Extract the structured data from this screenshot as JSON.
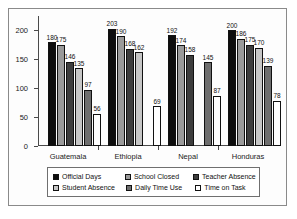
{
  "chart_data": {
    "type": "bar",
    "title": "",
    "subtitle": "",
    "xlabel": "",
    "ylabel": "",
    "ylim": [
      0,
      225
    ],
    "yticks": [
      0,
      50,
      100,
      150,
      200
    ],
    "grid": false,
    "legend_position": "bottom",
    "categories": [
      "Guatemala",
      "Ethiopia",
      "Nepal",
      "Honduras"
    ],
    "series": [
      {
        "name": "Official Days",
        "color": "#0d0d0d",
        "values": [
          180,
          203,
          192,
          200
        ]
      },
      {
        "name": "School Closed",
        "color": "#9a9a9a",
        "values": [
          175,
          190,
          174,
          186
        ]
      },
      {
        "name": "Teacher Absence",
        "color": "#3d3d3d",
        "values": [
          146,
          168,
          158,
          175
        ]
      },
      {
        "name": "Student Absence",
        "color": "#c6c6c6",
        "values": [
          135,
          162,
          null,
          170
        ]
      },
      {
        "name": "Daily Time Use",
        "color": "#6e6e6e",
        "values": [
          97,
          null,
          145,
          139
        ]
      },
      {
        "name": "Time on Task",
        "color": "#ffffff",
        "values": [
          56,
          69,
          87,
          78
        ]
      }
    ]
  },
  "legend": {
    "items": [
      {
        "label": "Official Days",
        "color": "#0d0d0d"
      },
      {
        "label": "School Closed",
        "color": "#9a9a9a"
      },
      {
        "label": "Teacher Absence",
        "color": "#3d3d3d"
      },
      {
        "label": "Student Absence",
        "color": "#c6c6c6"
      },
      {
        "label": "Daily Time Use",
        "color": "#6e6e6e"
      },
      {
        "label": "Time on Task",
        "color": "#ffffff"
      }
    ]
  }
}
